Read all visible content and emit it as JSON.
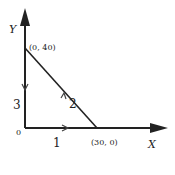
{
  "diagram": {
    "axes": {
      "x_label": "X",
      "y_label": "Y",
      "origin_label": "0"
    },
    "points": [
      {
        "label": "(0, 40)",
        "x": 0,
        "y": 40
      },
      {
        "label": "(30, 0)",
        "x": 30,
        "y": 0
      }
    ],
    "paths": [
      {
        "id": "1",
        "label": "1",
        "from": "(0, 0)",
        "to": "(30, 0)"
      },
      {
        "id": "2",
        "label": "2",
        "from": "(30, 0)",
        "to": "(0, 40)"
      },
      {
        "id": "3",
        "label": "3",
        "from": "(0, 40)",
        "to": "(0, 0)"
      }
    ],
    "colors": {
      "line": "#222222",
      "background": "#ffffff"
    }
  }
}
